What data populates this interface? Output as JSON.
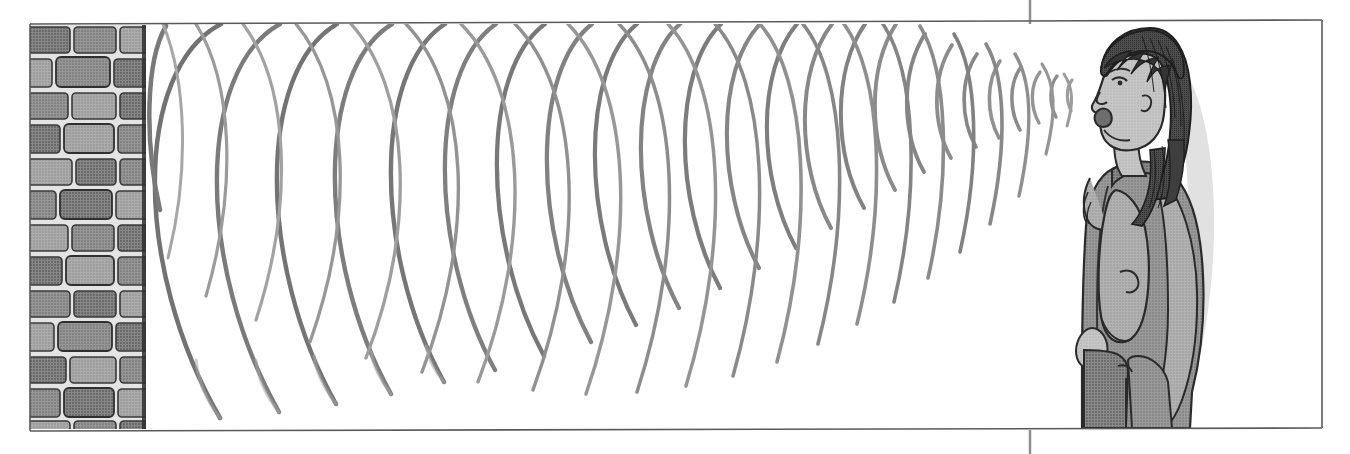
{
  "figure": {
    "alt_text": "A girl stands at the right facing left, shouting toward a tall brick wall at the left. Curved wavefronts travel from her mouth toward the wall, growing larger, and reflected wavefronts travel back, crossing the outgoing ones.",
    "background_color": "#ffffff",
    "frame": {
      "border_color": "#5a5a5a",
      "left": 30,
      "top": 24,
      "right": 1322,
      "bottom": 430
    },
    "crop_mark": {
      "name": "crop-mark-vertical",
      "x": 1030,
      "color": "#8a8a8a",
      "top_segment_from": 0,
      "top_segment_to": 24,
      "bottom_segment_from": 430,
      "bottom_segment_to": 454
    }
  },
  "wall": {
    "label": "brick wall",
    "x": 30,
    "y": 25,
    "width": 116,
    "height": 404,
    "brick_fill": "#8f8f8f",
    "brick_fill_alt": "#9d9d9d",
    "brick_dark": "#787878",
    "mortar_color": "#e8e8e8",
    "outline_color": "#343434",
    "edge_color": "#2b2b2b",
    "row_height": 34,
    "rows": 12,
    "bricks_per_row": 3
  },
  "waves": {
    "label": "sound wavefronts",
    "stroke_color": "#8e8e8e",
    "stroke_color_dark": "#707070",
    "stroke_color_light": "#a8a8a8",
    "source_x": 1085,
    "source_y": 96,
    "incident_count": 21,
    "reflected_count": 17,
    "description": "Arc-shaped wavefronts expanding leftward from the mouth and reflected arcs returning rightward from the wall"
  },
  "person": {
    "label": "girl shouting",
    "hair_color": "#4a4a4a",
    "hair_dark": "#2f2f2f",
    "skin_color": "#bdbdbd",
    "skin_shadow": "#9a9a9a",
    "coat_color": "#8b8b8b",
    "coat_light": "#a5a5a5",
    "coat_dark": "#6f6f6f",
    "pants_color": "#7c7c7c",
    "outline_color": "#2a2a2a",
    "x": 1050,
    "y": 28,
    "width": 200,
    "height": 402,
    "facing": "left",
    "mouth_state": "open"
  },
  "icons": {
    "sound-wave-icon": "))) ",
    "brick-wall-icon": "▦",
    "person-icon": "☻"
  }
}
